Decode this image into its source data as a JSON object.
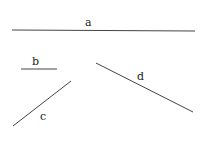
{
  "segments": [
    {
      "label": "a",
      "x1": 12,
      "y1": 30,
      "x2": 195,
      "y2": 31,
      "lx": 85,
      "ly": 26
    },
    {
      "label": "b",
      "x1": 21,
      "y1": 69,
      "x2": 57,
      "y2": 69,
      "lx": 32,
      "ly": 65
    },
    {
      "label": "c",
      "x1": 13,
      "y1": 126,
      "x2": 71,
      "y2": 81,
      "lx": 40,
      "ly": 120
    },
    {
      "label": "d",
      "x1": 96,
      "y1": 63,
      "x2": 193,
      "y2": 112,
      "lx": 137,
      "ly": 80
    }
  ],
  "line_color": "#444444"
}
